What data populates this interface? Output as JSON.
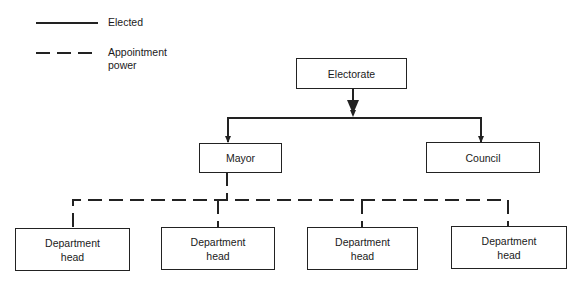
{
  "legend": {
    "elected": "Elected",
    "appointment_line1": "Appointment",
    "appointment_line2": "power"
  },
  "nodes": {
    "electorate": "Electorate",
    "mayor": "Mayor",
    "council": "Council",
    "departments": [
      {
        "line1": "Department",
        "line2": "head"
      },
      {
        "line1": "Department",
        "line2": "head"
      },
      {
        "line1": "Department",
        "line2": "head"
      },
      {
        "line1": "Department",
        "line2": "head"
      }
    ]
  },
  "colors": {
    "line": "#222222",
    "background": "#ffffff"
  }
}
